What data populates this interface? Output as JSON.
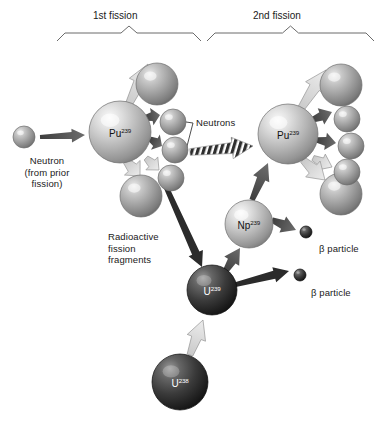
{
  "figure": {
    "background": "#ffffff"
  },
  "braces": [
    {
      "id": "brace-1st",
      "label": "1st fission",
      "x1": 57,
      "x2": 201,
      "label_x": 93,
      "label_y": 10
    },
    {
      "id": "brace-2nd",
      "label": "2nd fission",
      "x1": 207,
      "x2": 374,
      "label_x": 253,
      "label_y": 10
    }
  ],
  "labels": {
    "neutron_source": "Neutron\n(from prior\nfission)",
    "neutrons": "Neutrons",
    "fission_fragments": "Radioactive\nfission\nfragments",
    "beta_particle_1": "β particle",
    "beta_particle_2": "β particle"
  },
  "nuclides": [
    {
      "id": "pu239-first",
      "symbol": "Pu",
      "mass": "239",
      "cx": 120,
      "cy": 132,
      "r": 31,
      "shade": "light"
    },
    {
      "id": "pu239-second",
      "symbol": "Pu",
      "mass": "239",
      "cx": 288,
      "cy": 134,
      "r": 30,
      "shade": "light"
    },
    {
      "id": "np239",
      "symbol": "Np",
      "mass": "239",
      "cx": 249,
      "cy": 224,
      "r": 24,
      "shade": "light"
    },
    {
      "id": "u239",
      "symbol": "U",
      "mass": "239",
      "cx": 212,
      "cy": 290,
      "r": 25,
      "shade": "dark"
    },
    {
      "id": "u238",
      "symbol": "U",
      "mass": "238",
      "cx": 180,
      "cy": 382,
      "r": 28,
      "shade": "dark"
    }
  ],
  "particles": {
    "incoming_neutron": {
      "cx": 24,
      "cy": 137,
      "r": 11,
      "shade": "mid"
    },
    "fission_fragments_left": [
      {
        "cx": 157,
        "cy": 84,
        "r": 21,
        "shade": "mid"
      },
      {
        "cx": 141,
        "cy": 196,
        "r": 21,
        "shade": "mid"
      }
    ],
    "neutrons_left": [
      {
        "cx": 173,
        "cy": 122,
        "r": 13,
        "shade": "mid"
      },
      {
        "cx": 175,
        "cy": 150,
        "r": 13,
        "shade": "mid"
      },
      {
        "cx": 171,
        "cy": 178,
        "r": 13,
        "shade": "mid"
      }
    ],
    "fission_fragments_right": [
      {
        "cx": 341,
        "cy": 85,
        "r": 21,
        "shade": "mid"
      },
      {
        "cx": 341,
        "cy": 194,
        "r": 21,
        "shade": "mid"
      }
    ],
    "neutrons_right": [
      {
        "cx": 347,
        "cy": 119,
        "r": 13,
        "shade": "mid"
      },
      {
        "cx": 351,
        "cy": 146,
        "r": 13,
        "shade": "mid"
      },
      {
        "cx": 347,
        "cy": 172,
        "r": 13,
        "shade": "mid"
      }
    ],
    "beta_particles": [
      {
        "cx": 306,
        "cy": 232,
        "r": 6,
        "shade": "dark"
      },
      {
        "cx": 300,
        "cy": 275,
        "r": 6,
        "shade": "dark"
      }
    ]
  },
  "annotations": {
    "neutrons_label_x": 196,
    "neutrons_label_y": 118,
    "fission_fragments_label_x": 108,
    "fission_fragments_label_y": 231,
    "beta_1_label_x": 319,
    "beta_1_label_y": 243,
    "beta_2_label_x": 311,
    "beta_2_label_y": 287,
    "neutron_source_label_x": 6,
    "neutron_source_label_y": 155
  },
  "colors": {
    "sphere_light_highlight": "#f4f4f4",
    "sphere_light_mid": "#b9b9b9",
    "sphere_light_edge": "#8d8d8d",
    "sphere_mid_highlight": "#e2e2e2",
    "sphere_mid_body": "#9a9a9a",
    "sphere_mid_edge": "#6e6e6e",
    "sphere_dark_highlight": "#8a8a8a",
    "sphere_dark_body": "#3a3a3a",
    "sphere_dark_edge": "#161616",
    "arrow_dark": "#4a4a4a",
    "arrow_light": "#cfcfcf",
    "arrow_black": "#2b2b2b",
    "brace_line": "#6b6b6b",
    "text": "#1a1a1a"
  },
  "arrows": [
    {
      "id": "arrow-neutron-to-pu1",
      "tone": "dark",
      "x1": 40,
      "y1": 137,
      "x2": 85,
      "y2": 135,
      "w": 7
    },
    {
      "id": "arrow-pu1-fragment-up",
      "tone": "light",
      "x1": 128,
      "y1": 106,
      "x2": 148,
      "y2": 64,
      "w": 11
    },
    {
      "id": "arrow-pu1-neutron-1",
      "tone": "dark",
      "x1": 145,
      "y1": 118,
      "x2": 160,
      "y2": 115,
      "w": 9
    },
    {
      "id": "arrow-pu1-neutron-2",
      "tone": "dark",
      "x1": 150,
      "y1": 139,
      "x2": 162,
      "y2": 146,
      "w": 9
    },
    {
      "id": "arrow-pu1-neutron-3",
      "tone": "light",
      "x1": 146,
      "y1": 158,
      "x2": 159,
      "y2": 170,
      "w": 9
    },
    {
      "id": "arrow-pu1-fragment-down",
      "tone": "light",
      "x1": 126,
      "y1": 161,
      "x2": 140,
      "y2": 176,
      "w": 11
    },
    {
      "id": "arrow-hatched-to-pu2",
      "tone": "hatched",
      "x1": 190,
      "y1": 152,
      "x2": 253,
      "y2": 146,
      "w": 11
    },
    {
      "id": "arrow-neutron-to-u238",
      "tone": "black",
      "x1": 163,
      "y1": 180,
      "x2": 202,
      "y2": 267,
      "w": 8
    },
    {
      "id": "arrow-pu2-fragment-up",
      "tone": "light",
      "x1": 300,
      "y1": 110,
      "x2": 326,
      "y2": 70,
      "w": 11
    },
    {
      "id": "arrow-pu2-neutron-1",
      "tone": "dark",
      "x1": 312,
      "y1": 120,
      "x2": 332,
      "y2": 112,
      "w": 9
    },
    {
      "id": "arrow-pu2-neutron-2",
      "tone": "dark",
      "x1": 317,
      "y1": 140,
      "x2": 336,
      "y2": 143,
      "w": 9
    },
    {
      "id": "arrow-pu2-neutron-3",
      "tone": "light",
      "x1": 313,
      "y1": 158,
      "x2": 332,
      "y2": 167,
      "w": 9
    },
    {
      "id": "arrow-pu2-fragment-down",
      "tone": "light",
      "x1": 303,
      "y1": 160,
      "x2": 325,
      "y2": 180,
      "w": 11
    },
    {
      "id": "arrow-np-to-pu2",
      "tone": "dark",
      "x1": 252,
      "y1": 200,
      "x2": 268,
      "y2": 163,
      "w": 9
    },
    {
      "id": "arrow-u239-to-np",
      "tone": "dark",
      "x1": 225,
      "y1": 272,
      "x2": 240,
      "y2": 248,
      "w": 9
    },
    {
      "id": "arrow-np-to-beta1",
      "tone": "dark",
      "x1": 272,
      "y1": 220,
      "x2": 296,
      "y2": 230,
      "w": 9
    },
    {
      "id": "arrow-u239-to-beta2",
      "tone": "black",
      "x1": 234,
      "y1": 285,
      "x2": 289,
      "y2": 271,
      "w": 8
    },
    {
      "id": "arrow-u238-to-u239",
      "tone": "light",
      "x1": 190,
      "y1": 355,
      "x2": 203,
      "y2": 320,
      "w": 10
    }
  ]
}
